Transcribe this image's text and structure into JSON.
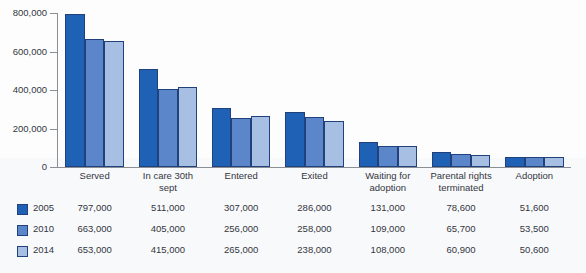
{
  "chart_data": {
    "type": "bar",
    "title": "",
    "xlabel": "",
    "ylabel": "",
    "ylim": [
      0,
      800000
    ],
    "ytick_labels": [
      "800,000",
      "600,000",
      "400,000",
      "200,000",
      "0"
    ],
    "ytick_values": [
      800000,
      600000,
      400000,
      200000,
      0
    ],
    "grid": false,
    "legend_position": "bottom-table",
    "categories": [
      "Served",
      "In care 30th sept",
      "Entered",
      "Exited",
      "Waiting for adoption",
      "Parental rights terminated",
      "Adoption"
    ],
    "category_lines": [
      [
        "Served"
      ],
      [
        "In care 30th",
        "sept"
      ],
      [
        "Entered"
      ],
      [
        "Exited"
      ],
      [
        "Waiting for",
        "adoption"
      ],
      [
        "Parental rights",
        "terminated"
      ],
      [
        "Adoption"
      ]
    ],
    "series": [
      {
        "name": "2005",
        "color": "#1f61b5",
        "values": [
          797000,
          511000,
          307000,
          286000,
          131000,
          78600,
          51600
        ],
        "labels": [
          "797,000",
          "511,000",
          "307,000",
          "286,000",
          "131,000",
          "78,600",
          "51,600"
        ]
      },
      {
        "name": "2010",
        "color": "#5b86ca",
        "values": [
          663000,
          405000,
          256000,
          258000,
          109000,
          65700,
          53500
        ],
        "labels": [
          "663,000",
          "405,000",
          "256,000",
          "258,000",
          "109,000",
          "65,700",
          "53,500"
        ]
      },
      {
        "name": "2014",
        "color": "#a8bfe4",
        "values": [
          653000,
          415000,
          265000,
          238000,
          108000,
          60900,
          50600
        ],
        "labels": [
          "653,000",
          "415,000",
          "265,000",
          "238,000",
          "108,000",
          "60,900",
          "50,600"
        ]
      }
    ]
  },
  "colors": {
    "series_2005": "#1f61b5",
    "series_2010": "#5b86ca",
    "series_2014": "#a8bfe4",
    "bar_outline": "#21417c",
    "axis": "#8a8f96",
    "text": "#33373d",
    "page_background": "#ffffff",
    "table_background": "#f8f9fb"
  }
}
